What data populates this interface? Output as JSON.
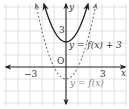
{
  "diagram": {
    "type": "function-graph",
    "axes": {
      "x_label": "x",
      "y_label": "y",
      "origin_label": "O",
      "tick_labels": {
        "x_neg": "−3",
        "x_pos": "3",
        "y_pos": "3"
      }
    },
    "curves": [
      {
        "name": "f(x)+3",
        "label": "y = f(x) + 3",
        "style": "solid",
        "color": "#222222",
        "vertex": [
          0,
          2
        ]
      },
      {
        "name": "f(x)",
        "label": "y = f(x)",
        "style": "dashed",
        "color": "#666666",
        "vertex": [
          0,
          -1
        ]
      }
    ],
    "grid": {
      "x_range": [
        -5,
        5
      ],
      "y_range": [
        -3,
        5
      ],
      "color": "#d8d8d8"
    }
  }
}
